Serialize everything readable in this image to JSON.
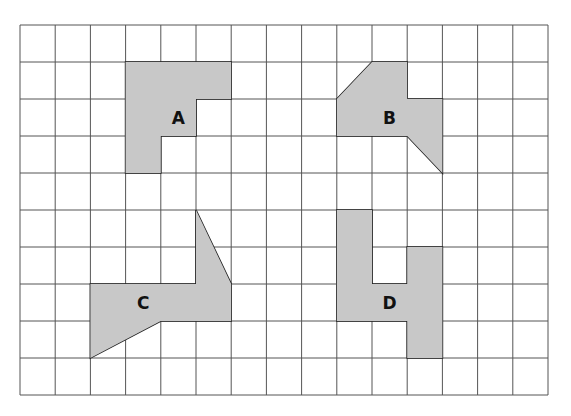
{
  "grid": {
    "left": 20,
    "top": 25,
    "cols": 15,
    "rows": 10,
    "cell_w": 35.2,
    "cell_h": 37,
    "line_color": "#555555",
    "background": "#ffffff"
  },
  "shape_style": {
    "fill": "#c8c8c8",
    "stroke": "#222222"
  },
  "shapes": [
    {
      "id": "A",
      "label": "A",
      "label_cell": [
        4,
        2
      ],
      "points": [
        [
          3,
          1
        ],
        [
          6,
          1
        ],
        [
          6,
          2
        ],
        [
          5,
          2
        ],
        [
          5,
          3
        ],
        [
          4,
          3
        ],
        [
          4,
          4
        ],
        [
          3,
          4
        ]
      ]
    },
    {
      "id": "B",
      "label": "B",
      "label_cell": [
        10,
        2
      ],
      "points": [
        [
          9,
          2
        ],
        [
          10,
          1
        ],
        [
          11,
          1
        ],
        [
          11,
          2
        ],
        [
          12,
          2
        ],
        [
          12,
          4
        ],
        [
          11,
          3
        ],
        [
          9,
          3
        ]
      ]
    },
    {
      "id": "C",
      "label": "C",
      "label_cell": [
        3,
        7
      ],
      "points": [
        [
          5,
          5
        ],
        [
          6,
          7
        ],
        [
          6,
          8
        ],
        [
          4,
          8
        ],
        [
          2,
          9
        ],
        [
          2,
          7
        ],
        [
          5,
          7
        ]
      ]
    },
    {
      "id": "D",
      "label": "D",
      "label_cell": [
        10,
        7
      ],
      "points": [
        [
          9,
          5
        ],
        [
          10,
          5
        ],
        [
          10,
          7
        ],
        [
          11,
          7
        ],
        [
          11,
          6
        ],
        [
          12,
          6
        ],
        [
          12,
          9
        ],
        [
          11,
          9
        ],
        [
          11,
          8
        ],
        [
          9,
          8
        ]
      ]
    }
  ]
}
